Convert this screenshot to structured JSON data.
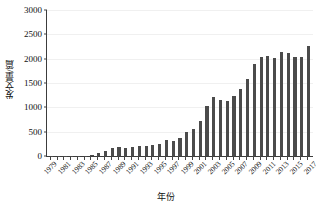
{
  "chart_data": {
    "type": "bar",
    "title": "",
    "subtitle": "",
    "xlabel": "年份",
    "ylabel": "发文量/篇",
    "ylim": [
      0,
      3000
    ],
    "yticks": [
      0,
      500,
      1000,
      1500,
      2000,
      2500,
      3000
    ],
    "ytick_labels": [
      "0",
      "500",
      "1000",
      "1500",
      "2000",
      "2500",
      "3000"
    ],
    "grid": true,
    "grid_axis": "y",
    "legend": false,
    "legend_position": "none",
    "bar_color": "#4b4b4b",
    "axis_color": "#3c3c3c",
    "gridline_color": "#f0f0f0",
    "background_color": "#ffffff",
    "xtick_label_rotation": -45,
    "xtick_label_interval": 2,
    "categories": [
      "1979",
      "1980",
      "1981",
      "1982",
      "1983",
      "1984",
      "1985",
      "1986",
      "1987",
      "1988",
      "1989",
      "1990",
      "1991",
      "1992",
      "1993",
      "1994",
      "1995",
      "1996",
      "1997",
      "1998",
      "1999",
      "2000",
      "2001",
      "2002",
      "2003",
      "2004",
      "2005",
      "2006",
      "2007",
      "2008",
      "2009",
      "2010",
      "2011",
      "2012",
      "2013",
      "2014",
      "2015",
      "2016",
      "2017"
    ],
    "visible_xtick_labels": [
      "1979",
      "1981",
      "1983",
      "1985",
      "1987",
      "1989",
      "1991",
      "1993",
      "1995",
      "1997",
      "1999",
      "2001",
      "2003",
      "2005",
      "2007",
      "2009",
      "2011",
      "2013",
      "2015",
      "2017"
    ],
    "values": [
      2,
      3,
      3,
      4,
      6,
      10,
      22,
      62,
      108,
      158,
      182,
      168,
      176,
      205,
      216,
      228,
      246,
      320,
      300,
      370,
      500,
      550,
      710,
      1020,
      1210,
      1155,
      1135,
      1235,
      1385,
      1590,
      1900,
      2040,
      2055,
      2020,
      2140,
      2115,
      2040,
      2030,
      2270
    ],
    "values_note": "annual publication counts read off the y-axis",
    "series": [
      {
        "name": "发文量",
        "values": [
          2,
          3,
          3,
          4,
          6,
          10,
          22,
          62,
          108,
          158,
          182,
          168,
          176,
          205,
          216,
          228,
          246,
          320,
          300,
          370,
          500,
          550,
          710,
          1020,
          1210,
          1155,
          1135,
          1235,
          1385,
          1590,
          1900,
          2040,
          2055,
          2020,
          2140,
          2115,
          2040,
          2030,
          2270
        ]
      }
    ]
  },
  "axes": {
    "y_title": "发文量/篇",
    "x_title": "年份"
  }
}
